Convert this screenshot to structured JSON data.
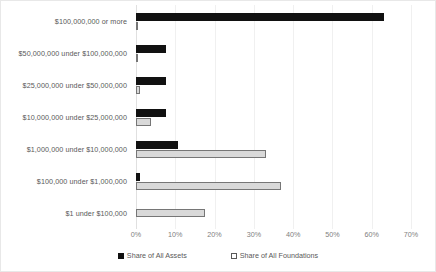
{
  "chart_data": {
    "type": "bar",
    "orientation": "horizontal",
    "title": "",
    "subtitle": "",
    "xlabel": "",
    "ylabel": "",
    "xlim": [
      0,
      70
    ],
    "xticks": [
      "0%",
      "10%",
      "20%",
      "30%",
      "40%",
      "50%",
      "60%",
      "70%"
    ],
    "xtick_values": [
      0,
      10,
      20,
      30,
      40,
      50,
      60,
      70
    ],
    "grid": true,
    "legend_position": "bottom",
    "categories": [
      "$100,000,000 or more",
      "$50,000,000 under $100,000,000",
      "$25,000,000 under $50,000,000",
      "$10,000,000 under $25,000,000",
      "$1,000,000 under $10,000,000",
      "$100,000 under $1,000,000",
      "$1 under $100,000"
    ],
    "series": [
      {
        "name": "Share of All Assets",
        "color": "#111111",
        "values": [
          63.0,
          7.6,
          7.6,
          7.6,
          10.7,
          1.0,
          0.0
        ]
      },
      {
        "name": "Share of All Foundations",
        "color": "#d9d9d9",
        "border_color": "#767676",
        "values": [
          0.6,
          0.6,
          1.0,
          3.8,
          33.0,
          37.0,
          17.6
        ]
      }
    ]
  },
  "legend": {
    "entries": [
      {
        "label": "Share of All Assets"
      },
      {
        "label": "Share of All Foundations"
      }
    ]
  }
}
